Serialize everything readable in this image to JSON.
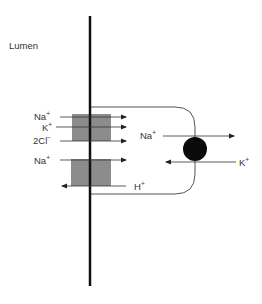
{
  "diagram": {
    "title": "",
    "compartment_label": "Lumen",
    "transporters": [
      {
        "name": "Na-K-2Cl cotransporter",
        "ions": [
          "Na+",
          "K+",
          "2Cl-"
        ],
        "direction": "into cell"
      },
      {
        "name": "Na-H exchanger",
        "ions_in": [
          "Na+"
        ],
        "ions_out": [
          "H+"
        ]
      },
      {
        "name": "Na-K pump",
        "ions_out_basolateral": [
          "Na+"
        ],
        "ions_in": [
          "K+"
        ]
      }
    ],
    "labels": {
      "na1": "Na",
      "na1_sup": "+",
      "k1": "K",
      "k1_sup": "+",
      "cl": "2Cl",
      "cl_sup": "−",
      "na2": "Na",
      "na2_sup": "+",
      "h": "H",
      "h_sup": "+",
      "na3": "Na",
      "na3_sup": "+",
      "k2": "K",
      "k2_sup": "+"
    },
    "colors": {
      "membrane": "#111111",
      "transporter_box": "#8c8c8c",
      "pump": "#0a0a0a",
      "lines": "#444444"
    }
  }
}
